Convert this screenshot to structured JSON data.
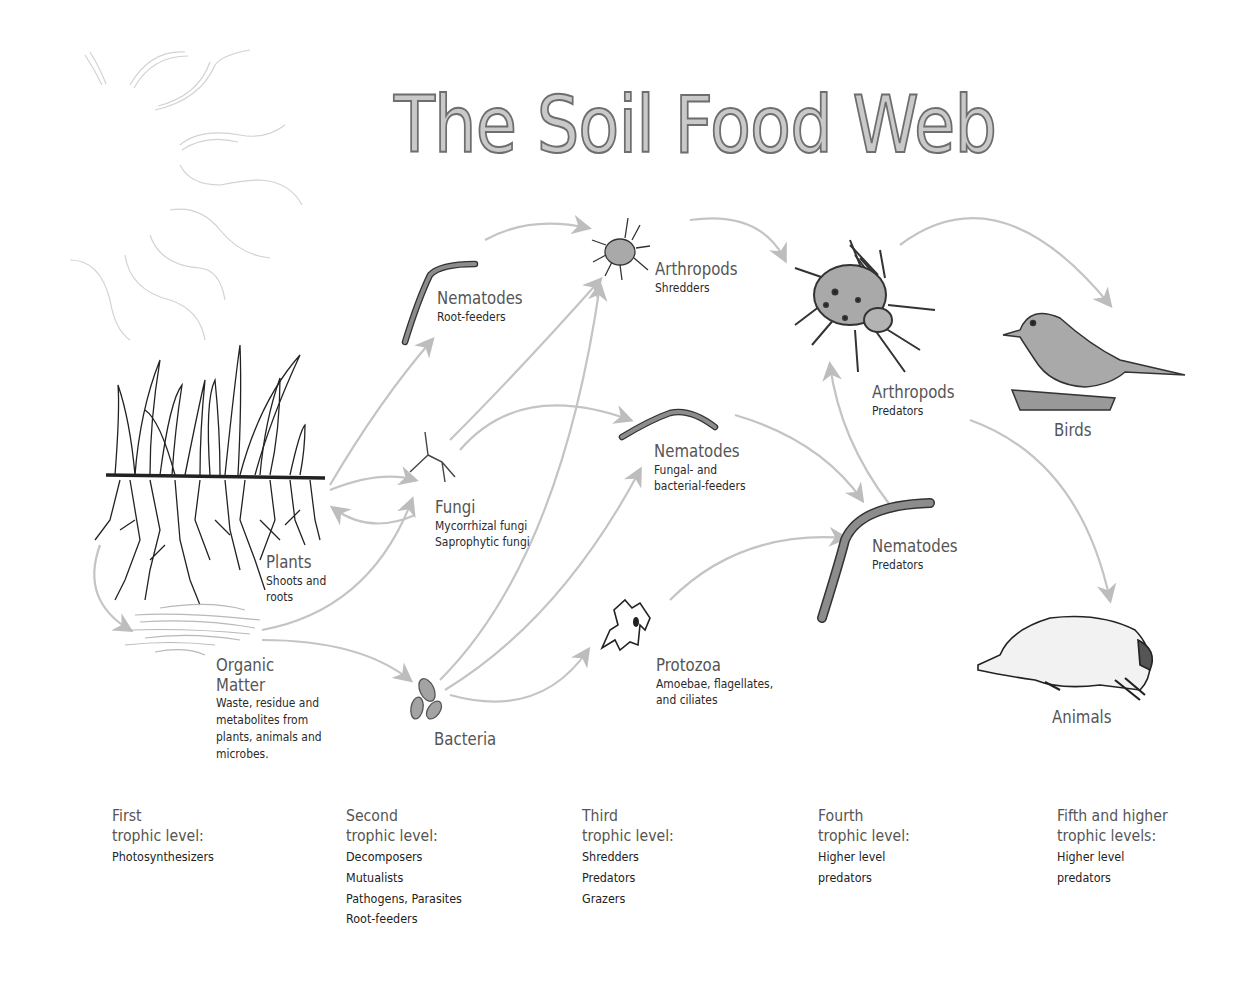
{
  "title": "The Soil Food Web",
  "nodes": {
    "plants": {
      "label": "Plants",
      "sub": [
        "Shoots and",
        "roots"
      ]
    },
    "organic_matter": {
      "label": [
        "Organic",
        "Matter"
      ],
      "sub": [
        "Waste, residue and",
        "metabolites from",
        "plants, animals and",
        "microbes."
      ]
    },
    "nematodes_root": {
      "label": "Nematodes",
      "sub": [
        "Root-feeders"
      ]
    },
    "fungi": {
      "label": "Fungi",
      "sub": [
        "Mycorrhizal fungi",
        "Saprophytic fungi"
      ]
    },
    "bacteria": {
      "label": "Bacteria"
    },
    "arthropods_shredders": {
      "label": "Arthropods",
      "sub": [
        "Shredders"
      ]
    },
    "nematodes_fungal": {
      "label": "Nematodes",
      "sub": [
        "Fungal- and",
        "bacterial-feeders"
      ]
    },
    "protozoa": {
      "label": "Protozoa",
      "sub": [
        "Amoebae, flagellates,",
        "and ciliates"
      ]
    },
    "arthropods_predators": {
      "label": "Arthropods",
      "sub": [
        "Predators"
      ]
    },
    "nematodes_predators": {
      "label": "Nematodes",
      "sub": [
        "Predators"
      ]
    },
    "birds": {
      "label": "Birds"
    },
    "animals": {
      "label": "Animals"
    }
  },
  "edges": [
    [
      "plants",
      "nematodes_root"
    ],
    [
      "plants",
      "fungi"
    ],
    [
      "fungi",
      "plants"
    ],
    [
      "plants",
      "organic_matter"
    ],
    [
      "organic_matter",
      "fungi"
    ],
    [
      "organic_matter",
      "bacteria"
    ],
    [
      "nematodes_root",
      "arthropods_shredders"
    ],
    [
      "fungi",
      "arthropods_shredders"
    ],
    [
      "bacteria",
      "arthropods_shredders"
    ],
    [
      "fungi",
      "nematodes_fungal"
    ],
    [
      "bacteria",
      "nematodes_fungal"
    ],
    [
      "bacteria",
      "protozoa"
    ],
    [
      "arthropods_shredders",
      "arthropods_predators"
    ],
    [
      "nematodes_fungal",
      "nematodes_predators"
    ],
    [
      "protozoa",
      "nematodes_predators"
    ],
    [
      "nematodes_predators",
      "arthropods_predators"
    ],
    [
      "arthropods_predators",
      "birds"
    ],
    [
      "arthropods_predators",
      "animals"
    ]
  ],
  "trophic_levels": [
    {
      "title": [
        "First",
        "trophic level:"
      ],
      "items": [
        "Photosynthesizers"
      ]
    },
    {
      "title": [
        "Second",
        "trophic level:"
      ],
      "items": [
        "Decomposers",
        "Mutualists",
        "Pathogens, Parasites",
        "Root-feeders"
      ]
    },
    {
      "title": [
        "Third",
        "trophic level:"
      ],
      "items": [
        "Shredders",
        "Predators",
        "Grazers"
      ]
    },
    {
      "title": [
        "Fourth",
        "trophic level:"
      ],
      "items": [
        "Higher level",
        "predators"
      ]
    },
    {
      "title": [
        "Fifth and higher",
        "trophic levels:"
      ],
      "items": [
        "Higher level",
        "predators"
      ]
    }
  ],
  "colors": {
    "arrow": "#c4c4c4",
    "organism_fill": "#a9a9a9",
    "outline": "#333333"
  }
}
